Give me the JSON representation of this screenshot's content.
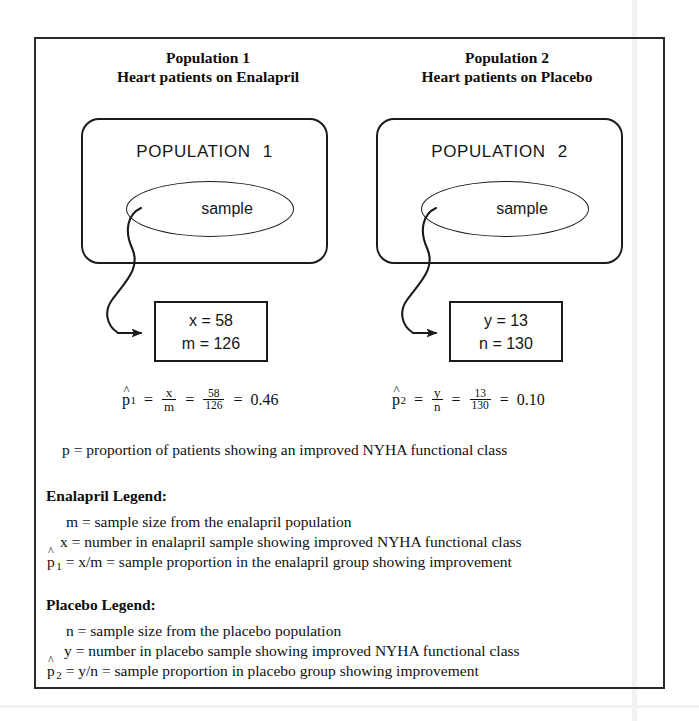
{
  "figure": {
    "columns": [
      {
        "header_line1": "Population 1",
        "header_line2": "Heart patients on Enalapril",
        "population_label": "POPULATION",
        "population_number": "1",
        "sample_label": "sample",
        "data_box": {
          "line1": "x = 58",
          "line2": "m = 126"
        }
      },
      {
        "header_line1": "Population 2",
        "header_line2": "Heart patients on Placebo",
        "population_label": "POPULATION",
        "population_number": "2",
        "sample_label": "sample",
        "data_box": {
          "line1": "y = 13",
          "line2": "n = 130"
        }
      }
    ],
    "formulas": [
      {
        "symbol": "p",
        "hat": "^",
        "subscript": "1",
        "eq1": "=",
        "frac_var_num": "x",
        "frac_var_den": "m",
        "eq2": "=",
        "frac_num_num": "58",
        "frac_num_den": "126",
        "eq3": "=",
        "result": "0.46"
      },
      {
        "symbol": "p",
        "hat": "^",
        "subscript": "2",
        "eq1": "=",
        "frac_var_num": "y",
        "frac_var_den": "n",
        "eq2": "=",
        "frac_num_num": "13",
        "frac_num_den": "130",
        "eq3": "=",
        "result": "0.10"
      }
    ],
    "p_definition": "p  =  proportion of patients showing an improved NYHA functional class",
    "legends": [
      {
        "heading": "Enalapril Legend:",
        "line1": "m  =  sample size from the enalapril population",
        "line2": "x  =  number in enalapril sample showing improved NYHA functional class",
        "line3_prefix": "p",
        "line3_hat": "^",
        "line3_sub": "1",
        "line3_rest": "  =  x/m  =  sample proportion in the enalapril group showing improvement"
      },
      {
        "heading": "Placebo Legend:",
        "line1": "n  =  sample size from the placebo population",
        "line2": "y  =  number in placebo sample showing improved NYHA functional class",
        "line3_prefix": "p",
        "line3_hat": "^",
        "line3_sub": "2",
        "line3_rest": "  =  y/n  =  sample proportion in placebo group showing improvement"
      }
    ],
    "colors": {
      "ink": "#111111",
      "frame": "#2a2a2a",
      "background": "#ffffff"
    }
  }
}
